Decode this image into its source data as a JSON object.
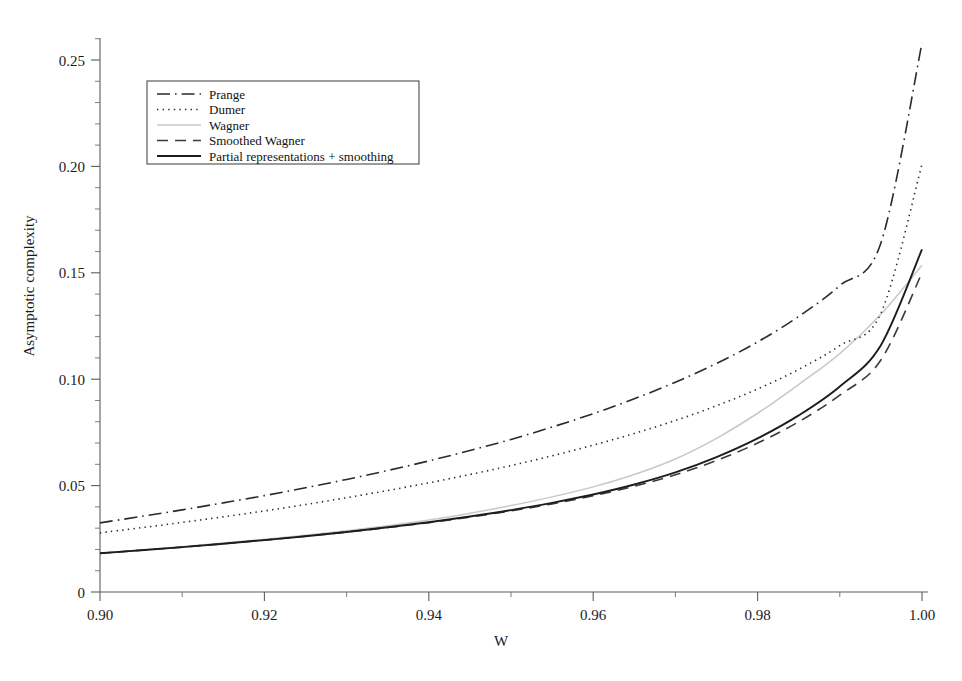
{
  "chart_data": {
    "type": "line",
    "title": "",
    "xlabel": "W",
    "ylabel": "Asymptotic complexity",
    "xlim": [
      0.9,
      1.0
    ],
    "ylim": [
      0.0,
      0.268
    ],
    "grid": false,
    "legend_position": "top-left",
    "x_ticks": [
      "0.90",
      "0.92",
      "0.94",
      "0.96",
      "0.98",
      "1.00"
    ],
    "x_tick_values": [
      0.9,
      0.92,
      0.94,
      0.96,
      0.98,
      1.0
    ],
    "x_minor_step": 0.01,
    "y_ticks": [
      "0",
      "0.05",
      "0.10",
      "0.15",
      "0.20",
      "0.25"
    ],
    "y_tick_values": [
      0,
      0.05,
      0.1,
      0.15,
      0.2,
      0.25
    ],
    "y_minor_step": 0.01,
    "x": [
      0.9,
      0.905,
      0.91,
      0.915,
      0.92,
      0.925,
      0.93,
      0.935,
      0.94,
      0.945,
      0.95,
      0.955,
      0.96,
      0.965,
      0.97,
      0.975,
      0.98,
      0.985,
      0.99,
      0.995,
      1.0
    ],
    "series": [
      {
        "name": "Prange",
        "style": "dash-dot",
        "color": "#2b2b2b",
        "width": 1.6,
        "values": [
          0.0325,
          0.0355,
          0.0386,
          0.0419,
          0.0453,
          0.049,
          0.0529,
          0.0571,
          0.0616,
          0.0665,
          0.0717,
          0.0775,
          0.0838,
          0.0908,
          0.0986,
          0.1074,
          0.1175,
          0.1295,
          0.144,
          0.164,
          0.258
        ]
      },
      {
        "name": "Dumer",
        "style": "dotted",
        "color": "#2b2b2b",
        "width": 1.6,
        "values": [
          0.0278,
          0.0302,
          0.0327,
          0.0353,
          0.0381,
          0.0411,
          0.0443,
          0.0477,
          0.0513,
          0.0552,
          0.0594,
          0.064,
          0.069,
          0.0745,
          0.0806,
          0.0875,
          0.0954,
          0.1046,
          0.1158,
          0.131,
          0.201
        ]
      },
      {
        "name": "Wagner",
        "style": "solid",
        "color": "#c8c8c8",
        "width": 1.5,
        "values": [
          0.0182,
          0.0197,
          0.0213,
          0.023,
          0.0248,
          0.0267,
          0.0288,
          0.0311,
          0.0338,
          0.037,
          0.0406,
          0.0447,
          0.0494,
          0.0552,
          0.0625,
          0.0722,
          0.084,
          0.0975,
          0.112,
          0.1305,
          0.1535
        ]
      },
      {
        "name": "Smoothed Wagner",
        "style": "dashed",
        "color": "#3a3a3a",
        "width": 1.6,
        "values": [
          0.0182,
          0.0196,
          0.0211,
          0.0227,
          0.0244,
          0.0262,
          0.0282,
          0.0303,
          0.0326,
          0.0352,
          0.0381,
          0.0414,
          0.0452,
          0.0497,
          0.0551,
          0.0618,
          0.07,
          0.08,
          0.0925,
          0.109,
          0.15
        ]
      },
      {
        "name": "Partial representations + smoothing",
        "style": "solid",
        "color": "#1d1d1d",
        "width": 1.9,
        "values": [
          0.0182,
          0.0196,
          0.0211,
          0.0227,
          0.0244,
          0.0262,
          0.0282,
          0.0304,
          0.0328,
          0.0355,
          0.0385,
          0.0419,
          0.0458,
          0.0505,
          0.0562,
          0.0634,
          0.0722,
          0.083,
          0.0966,
          0.116,
          0.161
        ]
      }
    ],
    "legend_entries": [
      {
        "label": "Prange",
        "style": "dash-dot",
        "color": "#2b2b2b"
      },
      {
        "label": "Dumer",
        "style": "dotted",
        "color": "#2b2b2b"
      },
      {
        "label": "Wagner",
        "style": "solid",
        "color": "#c8c8c8"
      },
      {
        "label": "Smoothed Wagner",
        "style": "dashed",
        "color": "#3a3a3a"
      },
      {
        "label": "Partial representations + smoothing",
        "style": "solid",
        "color": "#1d1d1d"
      }
    ]
  },
  "axes": {
    "x_title": "W",
    "y_title": "Asymptotic complexity"
  }
}
